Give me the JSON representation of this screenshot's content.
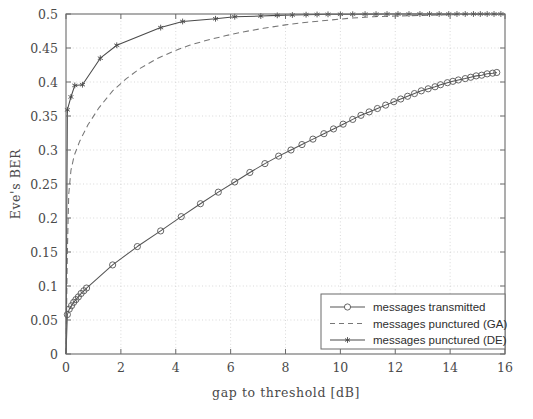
{
  "figure": {
    "background": "#ffffff",
    "axis_color": "#6b6b6b",
    "grid_color": "#c9c9c9",
    "curve_color": "#555555",
    "plot_box": {
      "left": 66,
      "top": 14,
      "right": 505,
      "bottom": 354
    }
  },
  "chart_data": {
    "type": "line",
    "title": "",
    "xlabel": "gap to threshold [dB]",
    "ylabel": "Eve's BER",
    "xlim": [
      0,
      16
    ],
    "ylim": [
      0,
      0.5
    ],
    "xticks": [
      0,
      2,
      4,
      6,
      8,
      10,
      12,
      14,
      16
    ],
    "xtick_labels": [
      "0",
      "2",
      "4",
      "6",
      "8",
      "10",
      "12",
      "14",
      "16"
    ],
    "yticks": [
      0,
      0.05,
      0.1,
      0.15,
      0.2,
      0.25,
      0.3,
      0.35,
      0.4,
      0.45,
      0.5
    ],
    "ytick_labels": [
      "0",
      "0.05",
      "0.1",
      "0.15",
      "0.2",
      "0.25",
      "0.3",
      "0.35",
      "0.4",
      "0.45",
      "0.5"
    ],
    "grid": true,
    "grid_style": "dotted",
    "legend_position": "lower right",
    "series": [
      {
        "name": "messages transmitted",
        "style": "solid",
        "marker": "circle",
        "color": "#555555",
        "points": [
          [
            0.0,
            0.0
          ],
          [
            0.05,
            0.058
          ],
          [
            0.12,
            0.066
          ],
          [
            0.2,
            0.071
          ],
          [
            0.28,
            0.076
          ],
          [
            0.36,
            0.08
          ],
          [
            0.45,
            0.084
          ],
          [
            0.55,
            0.089
          ],
          [
            0.65,
            0.093
          ],
          [
            0.75,
            0.097
          ],
          [
            1.7,
            0.131
          ],
          [
            2.6,
            0.158
          ],
          [
            3.45,
            0.181
          ],
          [
            4.2,
            0.202
          ],
          [
            4.9,
            0.221
          ],
          [
            5.55,
            0.238
          ],
          [
            6.15,
            0.253
          ],
          [
            6.7,
            0.267
          ],
          [
            7.25,
            0.28
          ],
          [
            7.75,
            0.291
          ],
          [
            8.2,
            0.3
          ],
          [
            8.6,
            0.308
          ],
          [
            9.0,
            0.316
          ],
          [
            9.4,
            0.324
          ],
          [
            9.75,
            0.331
          ],
          [
            10.1,
            0.338
          ],
          [
            10.45,
            0.345
          ],
          [
            10.75,
            0.351
          ],
          [
            11.05,
            0.356
          ],
          [
            11.35,
            0.361
          ],
          [
            11.65,
            0.366
          ],
          [
            11.95,
            0.371
          ],
          [
            12.2,
            0.375
          ],
          [
            12.45,
            0.379
          ],
          [
            12.7,
            0.383
          ],
          [
            12.95,
            0.387
          ],
          [
            13.2,
            0.39
          ],
          [
            13.45,
            0.393
          ],
          [
            13.65,
            0.396
          ],
          [
            13.9,
            0.399
          ],
          [
            14.1,
            0.401
          ],
          [
            14.3,
            0.403
          ],
          [
            14.55,
            0.405
          ],
          [
            14.75,
            0.407
          ],
          [
            14.95,
            0.409
          ],
          [
            15.15,
            0.41
          ],
          [
            15.35,
            0.412
          ],
          [
            15.55,
            0.413
          ],
          [
            15.7,
            0.414
          ]
        ]
      },
      {
        "name": "messages punctured (GA)",
        "style": "dashed",
        "marker": "none",
        "color": "#777777",
        "points": [
          [
            0.0,
            0.0
          ],
          [
            0.05,
            0.15
          ],
          [
            0.1,
            0.235
          ],
          [
            0.18,
            0.27
          ],
          [
            0.3,
            0.292
          ],
          [
            0.5,
            0.313
          ],
          [
            0.8,
            0.337
          ],
          [
            1.2,
            0.362
          ],
          [
            1.7,
            0.387
          ],
          [
            2.2,
            0.405
          ],
          [
            2.7,
            0.42
          ],
          [
            3.3,
            0.434
          ],
          [
            3.9,
            0.445
          ],
          [
            4.5,
            0.454
          ],
          [
            5.1,
            0.461
          ],
          [
            5.8,
            0.468
          ],
          [
            6.5,
            0.474
          ],
          [
            7.2,
            0.479
          ],
          [
            8.0,
            0.484
          ],
          [
            8.8,
            0.488
          ],
          [
            9.6,
            0.491
          ],
          [
            10.4,
            0.494
          ],
          [
            11.2,
            0.496
          ],
          [
            12.0,
            0.497
          ],
          [
            13.0,
            0.498
          ],
          [
            14.0,
            0.499
          ],
          [
            15.0,
            0.4995
          ],
          [
            16.0,
            0.4998
          ]
        ]
      },
      {
        "name": "messages punctured (DE)",
        "style": "solid",
        "marker": "star",
        "color": "#4a4a4a",
        "points": [
          [
            0.0,
            0.0
          ],
          [
            0.05,
            0.359
          ],
          [
            0.18,
            0.378
          ],
          [
            0.32,
            0.395
          ],
          [
            0.6,
            0.396
          ],
          [
            1.25,
            0.435
          ],
          [
            1.85,
            0.454
          ],
          [
            3.45,
            0.48
          ],
          [
            4.25,
            0.489
          ],
          [
            5.45,
            0.493
          ],
          [
            6.15,
            0.496
          ],
          [
            7.1,
            0.497
          ],
          [
            7.7,
            0.498
          ],
          [
            8.25,
            0.4985
          ],
          [
            8.75,
            0.499
          ],
          [
            9.15,
            0.4993
          ],
          [
            9.55,
            0.4995
          ],
          [
            10.0,
            0.4996
          ],
          [
            10.45,
            0.4997
          ],
          [
            10.9,
            0.4998
          ],
          [
            11.3,
            0.4998
          ],
          [
            11.7,
            0.4999
          ],
          [
            12.1,
            0.4999
          ],
          [
            12.5,
            0.4999
          ],
          [
            12.9,
            0.5
          ],
          [
            13.25,
            0.5
          ],
          [
            13.6,
            0.5
          ],
          [
            13.95,
            0.5
          ],
          [
            14.25,
            0.5
          ],
          [
            14.55,
            0.5
          ],
          [
            14.85,
            0.5
          ],
          [
            15.1,
            0.5
          ],
          [
            15.35,
            0.5
          ],
          [
            15.6,
            0.5
          ],
          [
            15.85,
            0.5
          ]
        ]
      }
    ]
  },
  "legend": {
    "entries": [
      {
        "label": "messages transmitted",
        "marker": "circle",
        "style": "solid"
      },
      {
        "label": "messages punctured (GA)",
        "marker": "none",
        "style": "dashed"
      },
      {
        "label": "messages punctured (DE)",
        "marker": "star",
        "style": "solid"
      }
    ]
  }
}
